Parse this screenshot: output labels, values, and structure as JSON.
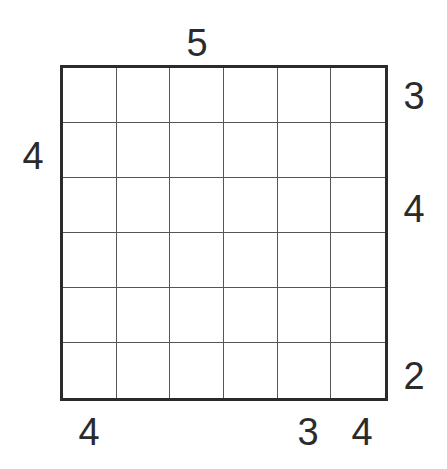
{
  "puzzle": {
    "type": "skyscraper",
    "size": 6,
    "clues": {
      "top": [
        "",
        "",
        "5",
        "",
        "",
        ""
      ],
      "bottom": [
        "4",
        "",
        "",
        "",
        "3",
        "4"
      ],
      "left": [
        "",
        "4",
        "",
        "",
        "",
        ""
      ],
      "right": [
        "3",
        "",
        "4",
        "",
        "",
        "2"
      ]
    },
    "cells": [
      [
        "",
        "",
        "",
        "",
        "",
        ""
      ],
      [
        "",
        "",
        "",
        "",
        "",
        ""
      ],
      [
        "",
        "",
        "",
        "",
        "",
        ""
      ],
      [
        "",
        "",
        "",
        "",
        "",
        ""
      ],
      [
        "",
        "",
        "",
        "",
        "",
        ""
      ],
      [
        "",
        "",
        "",
        "",
        "",
        ""
      ]
    ]
  }
}
